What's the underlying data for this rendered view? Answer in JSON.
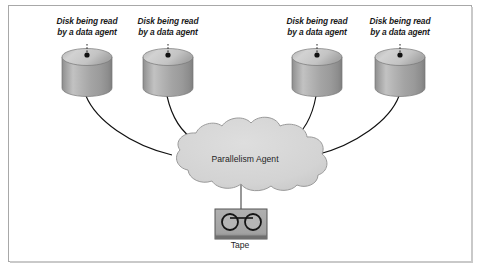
{
  "figure": {
    "background_color": "#ffffff",
    "frame_color": "#a8a8a8"
  },
  "disks": [
    {
      "id": "disk-1",
      "label": "Disk being read\nby a data agent",
      "x": 62,
      "y": 50
    },
    {
      "id": "disk-2",
      "label": "Disk being read\nby a data agent",
      "x": 143,
      "y": 50
    },
    {
      "id": "disk-3",
      "label": "Disk being read\nby a data agent",
      "x": 292,
      "y": 50
    },
    {
      "id": "disk-4",
      "label": "Disk being read\nby a data agent",
      "x": 375,
      "y": 50
    }
  ],
  "cloud": {
    "label": "Parallelism Agent",
    "fill_color": "#d5d5d5",
    "stroke_color": "#9a9a9a"
  },
  "tape": {
    "label": "Tape",
    "fill_color": "#a6a6a6",
    "stroke_color": "#4a4a4a",
    "reel_count": 2
  },
  "connectors": {
    "count": 5,
    "color": "#111111"
  }
}
